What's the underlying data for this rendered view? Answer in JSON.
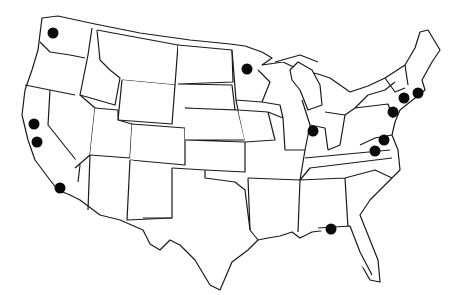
{
  "map": {
    "title": "",
    "region": "Contiguous United States",
    "style": "black outline state boundaries on white background",
    "colors": {
      "background": "#ffffff",
      "outline": "#1a1a1a",
      "marker": "#0a0a0a"
    },
    "markers": [
      {
        "id": "washington",
        "label": "Washington (Seattle area)",
        "x": 53,
        "y": 33
      },
      {
        "id": "california-north-1",
        "label": "Northern California (San Francisco Bay)",
        "x": 34,
        "y": 124
      },
      {
        "id": "california-north-2",
        "label": "Northern California (South Bay)",
        "x": 37,
        "y": 142
      },
      {
        "id": "california-south",
        "label": "Southern California (Los Angeles area)",
        "x": 60,
        "y": 188
      },
      {
        "id": "minnesota",
        "label": "Minnesota",
        "x": 247,
        "y": 69
      },
      {
        "id": "indiana",
        "label": "Indiana",
        "x": 313,
        "y": 131
      },
      {
        "id": "connecticut-rhode-island",
        "label": "Connecticut / Rhode Island",
        "x": 418,
        "y": 93
      },
      {
        "id": "new-york-city",
        "label": "New York City area",
        "x": 404,
        "y": 98
      },
      {
        "id": "new-jersey-philadelphia",
        "label": "New Jersey / Philadelphia",
        "x": 393,
        "y": 112
      },
      {
        "id": "maryland",
        "label": "Maryland (Baltimore)",
        "x": 384,
        "y": 140
      },
      {
        "id": "virginia-dc",
        "label": "Washington DC / Virginia",
        "x": 375,
        "y": 151
      },
      {
        "id": "florida",
        "label": "Florida (Tallahassee area)",
        "x": 331,
        "y": 229
      }
    ]
  }
}
